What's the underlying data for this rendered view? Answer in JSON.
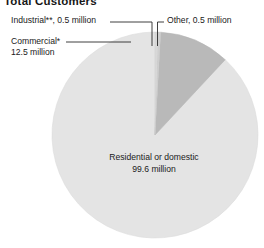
{
  "title": "Total Customers",
  "colors": {
    "residential": "#e4e4e4",
    "commercial": "#b9b9b9",
    "industrial": "#cfcfcf",
    "other": "#d9d9d9",
    "leader_line": "#2a2a2a",
    "slice_outline": "#c9c9c9",
    "text": "#1a1a1a",
    "background": "#ffffff"
  },
  "callouts": {
    "industrial": "Industrial**, 0.5 million",
    "other": "Other, 0.5 million",
    "commercial_line1": "Commercial*",
    "commercial_line2": "12.5 million",
    "residential_line1": "Residential or domestic",
    "residential_line2": "99.6 million"
  },
  "chart_data": {
    "type": "pie",
    "title": "Total Customers",
    "unit": "million",
    "total": 113.1,
    "legend": "none",
    "labels": [
      "Residential or domestic",
      "Commercial*",
      "Industrial**",
      "Other"
    ],
    "values": [
      99.6,
      12.5,
      0.5,
      0.5
    ],
    "value_labels": [
      "99.6 million",
      "12.5 million",
      "0.5 million",
      "0.5 million"
    ],
    "percentages": [
      88.06,
      11.05,
      0.44,
      0.44
    ],
    "slice_colors": [
      "#e4e4e4",
      "#b9b9b9",
      "#cfcfcf",
      "#d9d9d9"
    ],
    "start_angle_deg": 0,
    "direction": "counterclockwise",
    "footnotes": [
      "*",
      "**"
    ]
  }
}
